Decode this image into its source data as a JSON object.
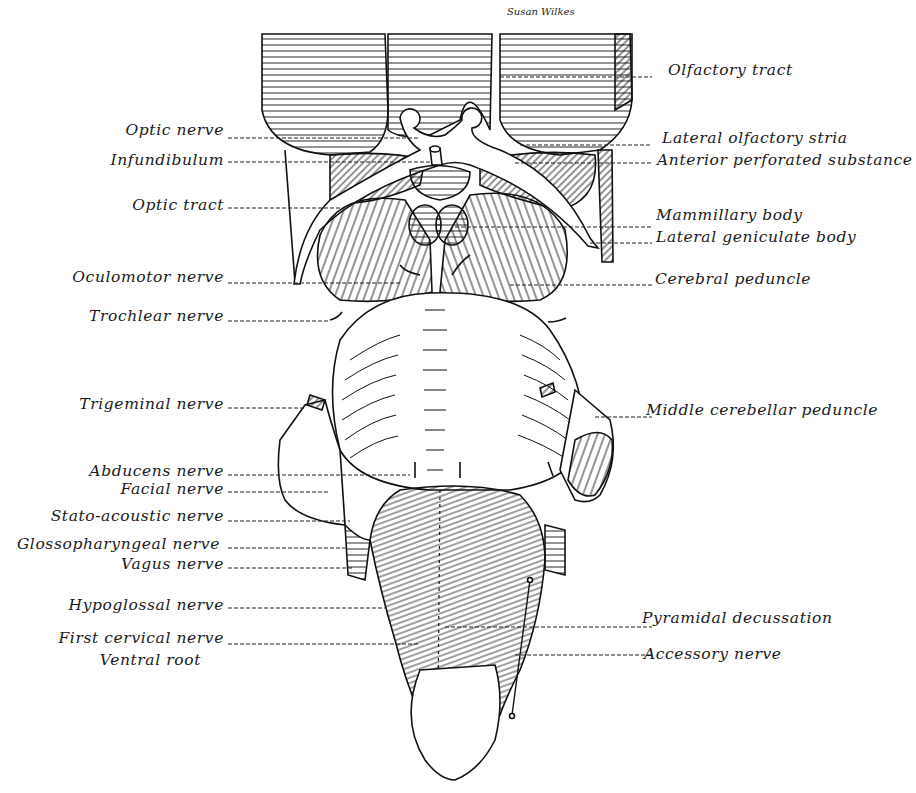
{
  "figure": {
    "signature": "Susan Wilkes",
    "ink_color": "#111111",
    "background": "#ffffff"
  },
  "labels_left": [
    {
      "id": "optic-nerve",
      "text": "Optic nerve",
      "x": 224,
      "y": 122
    },
    {
      "id": "infundibulum",
      "text": "Infundibulum",
      "x": 224,
      "y": 151
    },
    {
      "id": "optic-tract",
      "text": "Optic tract",
      "x": 224,
      "y": 196
    },
    {
      "id": "oculomotor-nerve",
      "text": "Oculomotor nerve",
      "x": 224,
      "y": 268
    },
    {
      "id": "trochlear-nerve",
      "text": "Trochlear nerve",
      "x": 224,
      "y": 307
    },
    {
      "id": "trigeminal-nerve",
      "text": "Trigeminal nerve",
      "x": 224,
      "y": 395
    },
    {
      "id": "abducens-nerve",
      "text": "Abducens nerve",
      "x": 224,
      "y": 463
    },
    {
      "id": "facial-nerve",
      "text": "Facial nerve",
      "x": 224,
      "y": 481
    },
    {
      "id": "stato-acoustic-nerve",
      "text": "Stato-acoustic nerve",
      "x": 224,
      "y": 508
    },
    {
      "id": "glossopharyngeal-nerve",
      "text": "Glossopharyngeal nerve",
      "x": 220,
      "y": 536
    },
    {
      "id": "vagus-nerve",
      "text": "Vagus nerve",
      "x": 224,
      "y": 556
    },
    {
      "id": "hypoglossal-nerve",
      "text": "Hypoglossal nerve",
      "x": 224,
      "y": 597
    },
    {
      "id": "first-cervical-nerve",
      "text": "First cervical nerve",
      "x": 224,
      "y": 630
    },
    {
      "id": "ventral-root",
      "text": "Ventral root",
      "x": 201,
      "y": 652
    }
  ],
  "labels_right": [
    {
      "id": "olfactory-tract",
      "text": "Olfactory tract",
      "x": 668,
      "y": 62
    },
    {
      "id": "lateral-olfactory-stria",
      "text": "Lateral olfactory stria",
      "x": 662,
      "y": 130
    },
    {
      "id": "anterior-perforated-substance",
      "text": "Anterior perforated substance",
      "x": 657,
      "y": 151
    },
    {
      "id": "mammillary-body",
      "text": "Mammillary body",
      "x": 656,
      "y": 206
    },
    {
      "id": "lateral-geniculate-body",
      "text": "Lateral geniculate body",
      "x": 656,
      "y": 229
    },
    {
      "id": "cerebral-peduncle",
      "text": "Cerebral peduncle",
      "x": 655,
      "y": 270
    },
    {
      "id": "middle-cerebellar-peduncle",
      "text": "Middle cerebellar peduncle",
      "x": 646,
      "y": 401
    },
    {
      "id": "pyramidal-decussation",
      "text": "Pyramidal decussation",
      "x": 642,
      "y": 609
    },
    {
      "id": "accessory-nerve",
      "text": "Accessory nerve",
      "x": 644,
      "y": 645
    }
  ],
  "leaders_left": [
    {
      "y": 138,
      "x2": 420
    },
    {
      "y": 162,
      "x2": 430
    },
    {
      "y": 208,
      "x2": 340
    },
    {
      "y": 283,
      "x2": 400
    },
    {
      "y": 321,
      "x2": 330
    },
    {
      "y": 408,
      "x2": 305
    },
    {
      "y": 475,
      "x2": 410
    },
    {
      "y": 492,
      "x2": 330
    },
    {
      "y": 521,
      "x2": 350
    },
    {
      "y": 548,
      "x2": 345
    },
    {
      "y": 568,
      "x2": 352
    },
    {
      "y": 608,
      "x2": 385
    },
    {
      "y": 644,
      "x2": 420
    }
  ],
  "leaders_right": [
    {
      "y": 77,
      "x1": 500
    },
    {
      "y": 145,
      "x1": 520
    },
    {
      "y": 163,
      "x1": 515
    },
    {
      "y": 227,
      "x1": 455
    },
    {
      "y": 243,
      "x1": 590
    },
    {
      "y": 285,
      "x1": 510
    },
    {
      "y": 417,
      "x1": 595
    },
    {
      "y": 627,
      "x1": 445
    },
    {
      "y": 655,
      "x1": 515
    }
  ]
}
